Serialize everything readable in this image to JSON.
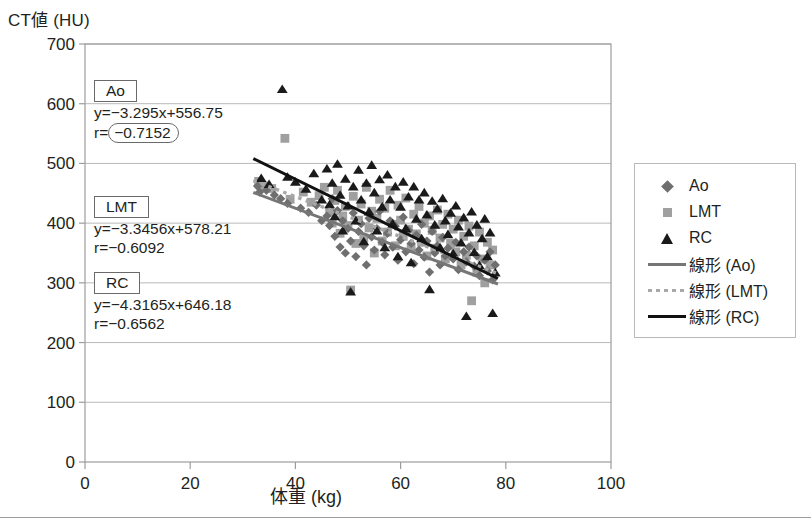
{
  "axes": {
    "y_title": "CT値 (HU)",
    "x_title": "体重 (kg)",
    "y_ticks": [
      "0",
      "100",
      "200",
      "300",
      "400",
      "500",
      "600",
      "700"
    ],
    "x_ticks": [
      "0",
      "20",
      "40",
      "60",
      "80",
      "100"
    ]
  },
  "annotations": {
    "ao": {
      "tag": "Ao",
      "equation": "y=−3.295x+556.75",
      "r_prefix": "r=",
      "r_value": "−0.7152",
      "highlighted": true
    },
    "lmt": {
      "tag": "LMT",
      "equation": "y=−3.3456x+578.21",
      "r_prefix": "r=",
      "r_value": "−0.6092",
      "highlighted": false
    },
    "rc": {
      "tag": "RC",
      "equation": "y=−4.3165x+646.18",
      "r_prefix": "r=",
      "r_value": "−0.6562",
      "highlighted": false
    }
  },
  "legend": {
    "items": [
      {
        "label": "Ao",
        "key": "diamond-marker"
      },
      {
        "label": "LMT",
        "key": "square-marker"
      },
      {
        "label": "RC",
        "key": "triangle-marker"
      },
      {
        "label": "線形 (Ao)",
        "key": "solid-gray-line"
      },
      {
        "label": "線形 (LMT)",
        "key": "dotted-gray-line"
      },
      {
        "label": "線形 (RC)",
        "key": "solid-black-line"
      }
    ]
  },
  "colors": {
    "ao": "#6f6f6f",
    "lmt": "#a0a0a0",
    "rc": "#1a1a1a",
    "grid": "#b9b9b9",
    "frame": "#9d9d9d",
    "text": "#231f20"
  },
  "chart_data": {
    "type": "scatter",
    "title": "",
    "xlabel": "体重 (kg)",
    "ylabel": "CT値 (HU)",
    "xlim": [
      0,
      100
    ],
    "ylim": [
      0,
      700
    ],
    "xticks": [
      0,
      20,
      40,
      60,
      80,
      100
    ],
    "yticks": [
      0,
      100,
      200,
      300,
      400,
      500,
      600,
      700
    ],
    "grid": "horizontal",
    "legend_position": "right-outside",
    "series": [
      {
        "name": "Ao",
        "marker": "diamond",
        "color": "#6f6f6f",
        "trendline": {
          "slope": -3.295,
          "intercept": 556.75,
          "r": -0.7152,
          "style": "solid",
          "color": "#767676",
          "equation": "y=−3.295x+556.75"
        },
        "points": [
          [
            32.8,
            462
          ],
          [
            33.2,
            452
          ],
          [
            34.5,
            455
          ],
          [
            36.0,
            447
          ],
          [
            37.2,
            441
          ],
          [
            38.5,
            433
          ],
          [
            41.0,
            425
          ],
          [
            42.5,
            418
          ],
          [
            44.0,
            430
          ],
          [
            45.0,
            404
          ],
          [
            46.0,
            412
          ],
          [
            46.5,
            396
          ],
          [
            47.0,
            441
          ],
          [
            47.5,
            378
          ],
          [
            48.0,
            421
          ],
          [
            48.5,
            360
          ],
          [
            49.0,
            404
          ],
          [
            49.5,
            350
          ],
          [
            50.0,
            391
          ],
          [
            50.5,
            370
          ],
          [
            51.0,
            417
          ],
          [
            51.5,
            344
          ],
          [
            52.0,
            386
          ],
          [
            52.5,
            399
          ],
          [
            53.0,
            362
          ],
          [
            53.5,
            330
          ],
          [
            54.0,
            408
          ],
          [
            54.5,
            377
          ],
          [
            55.0,
            355
          ],
          [
            55.5,
            391
          ],
          [
            56.0,
            420
          ],
          [
            56.5,
            368
          ],
          [
            57.0,
            347
          ],
          [
            57.5,
            383
          ],
          [
            58.0,
            404
          ],
          [
            58.5,
            360
          ],
          [
            59.0,
            395
          ],
          [
            59.5,
            338
          ],
          [
            60.0,
            372
          ],
          [
            60.5,
            410
          ],
          [
            61.0,
            352
          ],
          [
            61.5,
            388
          ],
          [
            62.0,
            366
          ],
          [
            62.5,
            332
          ],
          [
            63.0,
            380
          ],
          [
            63.5,
            355
          ],
          [
            64.0,
            398
          ],
          [
            64.5,
            343
          ],
          [
            65.0,
            370
          ],
          [
            65.5,
            318
          ],
          [
            66.0,
            386
          ],
          [
            66.5,
            350
          ],
          [
            67.0,
            362
          ],
          [
            67.5,
            330
          ],
          [
            68.0,
            376
          ],
          [
            68.5,
            345
          ],
          [
            69.0,
            358
          ],
          [
            70.0,
            340
          ],
          [
            70.5,
            368
          ],
          [
            71.0,
            322
          ],
          [
            72.0,
            352
          ],
          [
            72.5,
            335
          ],
          [
            73.0,
            360
          ],
          [
            74.0,
            328
          ],
          [
            74.5,
            345
          ],
          [
            75.0,
            312
          ],
          [
            76.0,
            338
          ],
          [
            76.5,
            320
          ],
          [
            77.0,
            352
          ],
          [
            77.5,
            305
          ],
          [
            78.0,
            330
          ]
        ]
      },
      {
        "name": "LMT",
        "marker": "square",
        "color": "#a0a0a0",
        "trendline": {
          "slope": -3.3456,
          "intercept": 578.21,
          "r": -0.6092,
          "style": "dotted",
          "color": "#a8a8a8",
          "equation": "y=−3.3456x+578.21"
        },
        "points": [
          [
            33.0,
            470
          ],
          [
            34.0,
            462
          ],
          [
            35.5,
            458
          ],
          [
            38.0,
            542
          ],
          [
            39.0,
            440
          ],
          [
            41.5,
            452
          ],
          [
            43.0,
            435
          ],
          [
            44.5,
            446
          ],
          [
            45.5,
            460
          ],
          [
            46.5,
            418
          ],
          [
            47.0,
            400
          ],
          [
            47.5,
            438
          ],
          [
            48.0,
            455
          ],
          [
            48.5,
            383
          ],
          [
            49.0,
            412
          ],
          [
            49.5,
            428
          ],
          [
            50.0,
            396
          ],
          [
            50.5,
            288
          ],
          [
            51.0,
            445
          ],
          [
            51.5,
            366
          ],
          [
            52.0,
            405
          ],
          [
            52.5,
            432
          ],
          [
            53.0,
            375
          ],
          [
            53.5,
            460
          ],
          [
            54.0,
            392
          ],
          [
            54.5,
            420
          ],
          [
            55.0,
            350
          ],
          [
            55.5,
            408
          ],
          [
            56.0,
            440
          ],
          [
            56.5,
            370
          ],
          [
            57.0,
            425
          ],
          [
            57.5,
            385
          ],
          [
            58.0,
            455
          ],
          [
            58.5,
            398
          ],
          [
            59.0,
            362
          ],
          [
            59.5,
            430
          ],
          [
            60.0,
            405
          ],
          [
            60.5,
            378
          ],
          [
            61.0,
            442
          ],
          [
            61.5,
            390
          ],
          [
            62.0,
            358
          ],
          [
            62.5,
            415
          ],
          [
            63.0,
            382
          ],
          [
            63.5,
            428
          ],
          [
            64.0,
            368
          ],
          [
            64.5,
            400
          ],
          [
            65.0,
            345
          ],
          [
            65.5,
            412
          ],
          [
            66.0,
            388
          ],
          [
            66.5,
            358
          ],
          [
            67.0,
            422
          ],
          [
            67.5,
            375
          ],
          [
            68.0,
            398
          ],
          [
            68.5,
            340
          ],
          [
            69.0,
            415
          ],
          [
            69.5,
            366
          ],
          [
            70.0,
            390
          ],
          [
            70.5,
            352
          ],
          [
            71.0,
            405
          ],
          [
            71.5,
            330
          ],
          [
            72.0,
            378
          ],
          [
            72.5,
            346
          ],
          [
            73.0,
            395
          ],
          [
            73.5,
            270
          ],
          [
            74.0,
            362
          ],
          [
            74.5,
            318
          ],
          [
            75.0,
            385
          ],
          [
            75.5,
            340
          ],
          [
            76.0,
            300
          ],
          [
            76.5,
            368
          ],
          [
            77.0,
            330
          ],
          [
            77.5,
            355
          ]
        ]
      },
      {
        "name": "RC",
        "marker": "triangle",
        "color": "#1a1a1a",
        "trendline": {
          "slope": -4.3165,
          "intercept": 646.18,
          "r": -0.6562,
          "style": "solid",
          "color": "#111111",
          "equation": "y=−4.3165x+646.18"
        },
        "points": [
          [
            33.5,
            476
          ],
          [
            35.0,
            466
          ],
          [
            37.5,
            625
          ],
          [
            38.5,
            478
          ],
          [
            40.0,
            470
          ],
          [
            42.0,
            458
          ],
          [
            43.5,
            484
          ],
          [
            45.0,
            440
          ],
          [
            46.0,
            492
          ],
          [
            46.5,
            432
          ],
          [
            47.0,
            468
          ],
          [
            47.5,
            412
          ],
          [
            48.0,
            500
          ],
          [
            48.5,
            448
          ],
          [
            49.0,
            388
          ],
          [
            49.5,
            475
          ],
          [
            50.0,
            430
          ],
          [
            50.5,
            286
          ],
          [
            51.0,
            462
          ],
          [
            51.5,
            405
          ],
          [
            52.0,
            490
          ],
          [
            52.5,
            440
          ],
          [
            53.0,
            370
          ],
          [
            53.5,
            468
          ],
          [
            54.0,
            420
          ],
          [
            54.5,
            498
          ],
          [
            55.0,
            452
          ],
          [
            55.5,
            388
          ],
          [
            56.0,
            474
          ],
          [
            56.5,
            428
          ],
          [
            57.0,
            360
          ],
          [
            57.5,
            482
          ],
          [
            58.0,
            440
          ],
          [
            58.5,
            400
          ],
          [
            59.0,
            462
          ],
          [
            59.5,
            345
          ],
          [
            60.0,
            428
          ],
          [
            60.5,
            470
          ],
          [
            61.0,
            392
          ],
          [
            61.5,
            445
          ],
          [
            62.0,
            335
          ],
          [
            62.5,
            462
          ],
          [
            63.0,
            408
          ],
          [
            63.5,
            440
          ],
          [
            64.0,
            375
          ],
          [
            64.5,
            452
          ],
          [
            65.0,
            415
          ],
          [
            65.5,
            290
          ],
          [
            66.0,
            438
          ],
          [
            66.5,
            398
          ],
          [
            67.0,
            425
          ],
          [
            67.5,
            360
          ],
          [
            68.0,
            442
          ],
          [
            68.5,
            405
          ],
          [
            69.0,
            382
          ],
          [
            69.5,
            418
          ],
          [
            70.0,
            350
          ],
          [
            70.5,
            430
          ],
          [
            71.0,
            395
          ],
          [
            71.5,
            368
          ],
          [
            72.0,
            410
          ],
          [
            72.5,
            245
          ],
          [
            73.0,
            385
          ],
          [
            73.5,
            420
          ],
          [
            74.0,
            352
          ],
          [
            74.5,
            398
          ],
          [
            75.0,
            330
          ],
          [
            75.5,
            375
          ],
          [
            76.0,
            408
          ],
          [
            76.5,
            345
          ],
          [
            77.0,
            385
          ],
          [
            77.5,
            250
          ],
          [
            78.0,
            318
          ]
        ]
      }
    ],
    "notes": [
      "Ao: y=−3.295x+556.75, r=−0.7152",
      "LMT: y=−3.3456x+578.21, r=−0.6092",
      "RC: y=−4.3165x+646.18, r=−0.6562"
    ]
  }
}
